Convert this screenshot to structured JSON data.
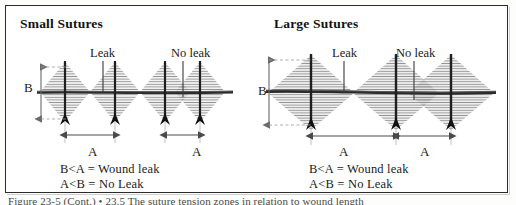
{
  "figure": {
    "caption": "Figure 23-5 (Cont.) • 23.5  The suture tension zones in relation to wound length",
    "border_color": "#2b2b2b",
    "ink_color": "#1a1a1a",
    "hatch_color": "#8a8a8a"
  },
  "panels": [
    {
      "id": "small",
      "title": "Small Sutures",
      "callouts": [
        {
          "name": "leak",
          "text": "Leak"
        },
        {
          "name": "no-leak",
          "text": "No leak"
        }
      ],
      "dimensions": {
        "vertical_label": "B",
        "horizontal_labels": [
          "A",
          "A"
        ]
      },
      "rules": [
        "B<A = Wound leak",
        "A<B = No Leak"
      ],
      "suture_count": 4
    },
    {
      "id": "large",
      "title": "Large Sutures",
      "callouts": [
        {
          "name": "leak",
          "text": "Leak"
        },
        {
          "name": "no-leak",
          "text": "No leak"
        }
      ],
      "dimensions": {
        "vertical_label": "B",
        "horizontal_labels": [
          "A",
          "A"
        ]
      },
      "rules": [
        "B<A = Wound leak",
        "A<B = No Leak"
      ],
      "suture_count": 3
    }
  ]
}
